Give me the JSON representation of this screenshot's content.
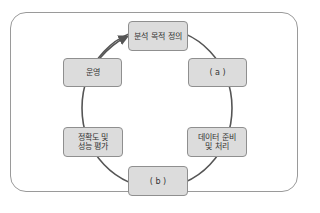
{
  "diagram": {
    "type": "cycle",
    "direction": "clockwise",
    "nodes": [
      {
        "id": "define",
        "label": "분석 목적 정의"
      },
      {
        "id": "a",
        "label": "( a )"
      },
      {
        "id": "prepare",
        "label": "데이터 준비\n및 처리"
      },
      {
        "id": "b",
        "label": "( b )"
      },
      {
        "id": "evaluate",
        "label": "정확도 및\n성능 평가"
      },
      {
        "id": "operate",
        "label": "운영"
      }
    ],
    "edges": [
      {
        "from": "define",
        "to": "a"
      },
      {
        "from": "a",
        "to": "prepare"
      },
      {
        "from": "prepare",
        "to": "b"
      },
      {
        "from": "b",
        "to": "evaluate"
      },
      {
        "from": "evaluate",
        "to": "operate"
      },
      {
        "from": "operate",
        "to": "define",
        "arrow": true
      }
    ],
    "colors": {
      "node_fill": "#dcdcdc",
      "node_border": "#8f8f8f",
      "edge": "#555555",
      "frame": "#9a9a9a"
    }
  }
}
